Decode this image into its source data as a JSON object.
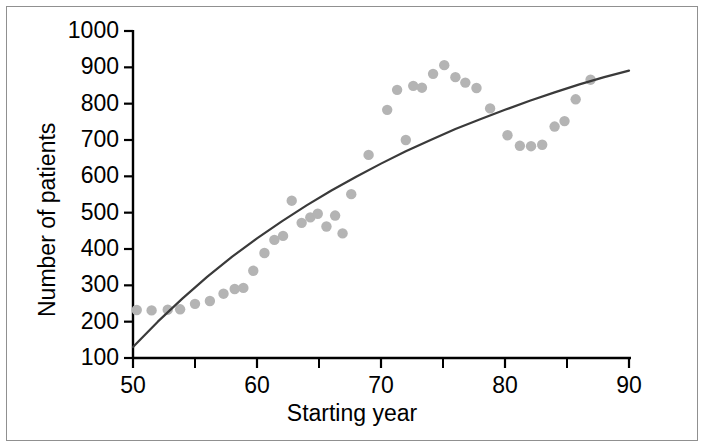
{
  "chart_data": {
    "type": "scatter",
    "title": "",
    "xlabel": "Starting year",
    "ylabel": "Number of patients",
    "xlim": [
      50,
      90
    ],
    "ylim": [
      100,
      1000
    ],
    "xticks": [
      50,
      60,
      70,
      80,
      90
    ],
    "xtick_labels": [
      "50",
      "60",
      "70",
      "80",
      "90"
    ],
    "xminor_ticks": [
      55,
      65,
      75,
      85
    ],
    "yticks": [
      100,
      200,
      300,
      400,
      500,
      600,
      700,
      800,
      900,
      1000
    ],
    "ytick_labels": [
      "100",
      "200",
      "300",
      "400",
      "500",
      "600",
      "700",
      "800",
      "900",
      "1000"
    ],
    "grid": false,
    "legend": false,
    "point_color": "#b4b4b4",
    "line_color": "#3a3a3a",
    "axis_color": "#000000",
    "background": "#ffffff",
    "border_color": "#909090",
    "series": [
      {
        "name": "Observed patients",
        "type": "scatter",
        "marker": "circle",
        "color": "#b4b4b4",
        "points": [
          [
            50.3,
            232
          ],
          [
            51.5,
            231
          ],
          [
            52.8,
            233
          ],
          [
            53.8,
            234
          ],
          [
            55.0,
            249
          ],
          [
            56.2,
            257
          ],
          [
            57.3,
            277
          ],
          [
            58.2,
            290
          ],
          [
            58.9,
            293
          ],
          [
            59.7,
            340
          ],
          [
            60.6,
            389
          ],
          [
            61.4,
            425
          ],
          [
            62.1,
            436
          ],
          [
            62.8,
            533
          ],
          [
            63.6,
            472
          ],
          [
            64.3,
            487
          ],
          [
            64.9,
            497
          ],
          [
            65.6,
            462
          ],
          [
            66.3,
            492
          ],
          [
            66.9,
            443
          ],
          [
            67.6,
            551
          ],
          [
            69.0,
            659
          ],
          [
            70.5,
            783
          ],
          [
            71.3,
            838
          ],
          [
            72.0,
            700
          ],
          [
            72.6,
            849
          ],
          [
            73.3,
            844
          ],
          [
            74.2,
            882
          ],
          [
            75.1,
            906
          ],
          [
            76.0,
            873
          ],
          [
            76.8,
            858
          ],
          [
            77.7,
            843
          ],
          [
            78.8,
            787
          ],
          [
            80.2,
            713
          ],
          [
            81.2,
            684
          ],
          [
            82.1,
            683
          ],
          [
            83.0,
            687
          ],
          [
            84.0,
            737
          ],
          [
            84.8,
            752
          ],
          [
            85.7,
            812
          ],
          [
            86.9,
            866
          ]
        ]
      },
      {
        "name": "Fitted trend",
        "type": "line",
        "color": "#3a3a3a",
        "points": [
          [
            50.0,
            130
          ],
          [
            52.0,
            200
          ],
          [
            54.0,
            264
          ],
          [
            56.0,
            324
          ],
          [
            58.0,
            379
          ],
          [
            60.0,
            429
          ],
          [
            62.0,
            476
          ],
          [
            64.0,
            520
          ],
          [
            66.0,
            561
          ],
          [
            68.0,
            599
          ],
          [
            70.0,
            635
          ],
          [
            72.0,
            669
          ],
          [
            74.0,
            700
          ],
          [
            76.0,
            730
          ],
          [
            78.0,
            757
          ],
          [
            80.0,
            783
          ],
          [
            82.0,
            808
          ],
          [
            84.0,
            831
          ],
          [
            86.0,
            853
          ],
          [
            88.0,
            873
          ],
          [
            90.0,
            891
          ]
        ]
      }
    ]
  }
}
